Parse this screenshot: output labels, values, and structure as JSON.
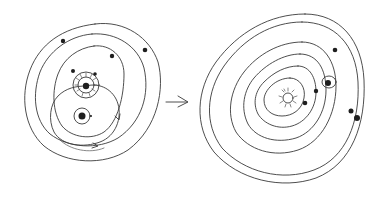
{
  "diagram": {
    "left_system": {
      "label": "circular orbits system",
      "orbit_count": 3,
      "center": "sun",
      "bodies": [
        "planet",
        "planet",
        "planet",
        "planet",
        "planet",
        "companion-body"
      ],
      "extra": "looping orbit path with arrows around a companion body"
    },
    "connector": {
      "label": "arrow",
      "direction": "right"
    },
    "right_system": {
      "label": "elliptical orbits system",
      "orbit_count": 6,
      "center": "sun",
      "bodies": [
        "planet",
        "planet",
        "planet-with-ring",
        "planet",
        "planet",
        "planet"
      ]
    },
    "colors": {
      "ink": "#3a3a3a",
      "fill": "#1e1e1e",
      "background": "#ffffff"
    }
  }
}
